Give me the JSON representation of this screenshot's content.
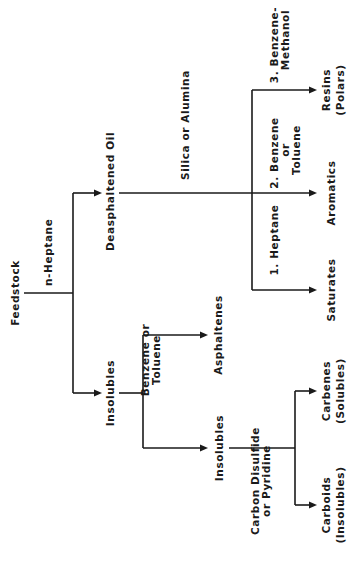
{
  "diagram": {
    "orientation": "rotated-90-ccw",
    "root": "Feedstock",
    "nodes": {
      "feedstock": "Feedstock",
      "deasphaltened_oil": "Deasphaltened Oil",
      "insolubles_1": "Insolubles",
      "asphaltenes": "Asphaltenes",
      "insolubles_2": "Insolubles",
      "carbenes": [
        "Carbenes",
        "(Solubles)"
      ],
      "carboids": [
        "Carboids",
        "(Insolubles)"
      ],
      "saturates": "Saturates",
      "aromatics": "Aromatics",
      "resins": [
        "Resins",
        "(Polars)"
      ]
    },
    "edge_labels": {
      "n_heptane": "n-Heptane",
      "silica_or_alumina": "Silica or Alumina",
      "benzene_or_toluene_1": [
        "Benzene or",
        "Toluene"
      ],
      "cs2_or_pyridine": [
        "Carbon Disulfide",
        "or Pyridine"
      ],
      "heptane_1": "1. Heptane",
      "benzene_or_toluene_2": [
        "2. Benzene",
        "or",
        "Toluene"
      ],
      "benzene_methanol_3": [
        "3. Benzene-",
        "Methanol"
      ]
    },
    "edges": [
      {
        "from": "Feedstock",
        "to": "Deasphaltened Oil",
        "via": "n-Heptane"
      },
      {
        "from": "Feedstock",
        "to": "Insolubles",
        "via": "n-Heptane"
      },
      {
        "from": "Deasphaltened Oil",
        "to": "Saturates",
        "via": "Silica or Alumina / 1. Heptane"
      },
      {
        "from": "Deasphaltened Oil",
        "to": "Aromatics",
        "via": "Silica or Alumina / 2. Benzene or Toluene"
      },
      {
        "from": "Deasphaltened Oil",
        "to": "Resins (Polars)",
        "via": "Silica or Alumina / 3. Benzene-Methanol"
      },
      {
        "from": "Insolubles",
        "to": "Asphaltenes",
        "via": "Benzene or Toluene"
      },
      {
        "from": "Insolubles",
        "to": "Insolubles",
        "via": "Benzene or Toluene"
      },
      {
        "from": "Insolubles",
        "to": "Carbenes (Solubles)",
        "via": "Carbon Disulfide or Pyridine"
      },
      {
        "from": "Insolubles",
        "to": "Carboids (Insolubles)",
        "via": "Carbon Disulfide or Pyridine"
      }
    ]
  }
}
